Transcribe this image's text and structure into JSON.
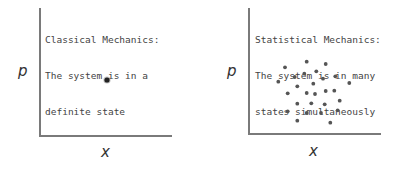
{
  "left_panel": {
    "caption_line1": "Classical Mechanics:",
    "caption_line2": "The system is in a",
    "caption_line3": "definite state",
    "y_label": "p",
    "x_label": "x"
  },
  "right_panel": {
    "caption_line1": "Statistical Mechanics:",
    "caption_line2": "The system is in many",
    "caption_line3": "states simultaneously",
    "y_label": "p",
    "x_label": "x"
  },
  "colors": {
    "axis": "#7a7a7a",
    "dot": "#555555",
    "text": "#444444"
  },
  "chart_data": [
    {
      "type": "scatter",
      "title": "Classical Mechanics: The system is in a definite state",
      "xlabel": "x",
      "ylabel": "p",
      "points": [
        [
          107,
          80
        ]
      ]
    },
    {
      "type": "scatter",
      "title": "Statistical Mechanics: The system is in many states simultaneously",
      "xlabel": "x",
      "ylabel": "p",
      "points": [
        [
          306.7,
          61.7
        ],
        [
          325.7,
          64
        ],
        [
          285,
          67.3
        ],
        [
          316.3,
          71.3
        ],
        [
          304.3,
          73.7
        ],
        [
          294.7,
          77
        ],
        [
          335.3,
          76.3
        ],
        [
          323,
          78.7
        ],
        [
          278.3,
          81.7
        ],
        [
          313.3,
          83.7
        ],
        [
          349.3,
          83
        ],
        [
          297.3,
          86.3
        ],
        [
          287.7,
          93.3
        ],
        [
          306.7,
          93
        ],
        [
          315,
          94
        ],
        [
          325.7,
          91
        ],
        [
          334.3,
          90.7
        ],
        [
          297.3,
          103.7
        ],
        [
          311.3,
          103.3
        ],
        [
          324.7,
          104.3
        ],
        [
          339.7,
          100.7
        ],
        [
          287.7,
          111.3
        ],
        [
          306.7,
          113
        ],
        [
          321,
          113
        ],
        [
          337.7,
          110.3
        ],
        [
          297.3,
          120.7
        ],
        [
          330.3,
          122.7
        ]
      ]
    }
  ]
}
